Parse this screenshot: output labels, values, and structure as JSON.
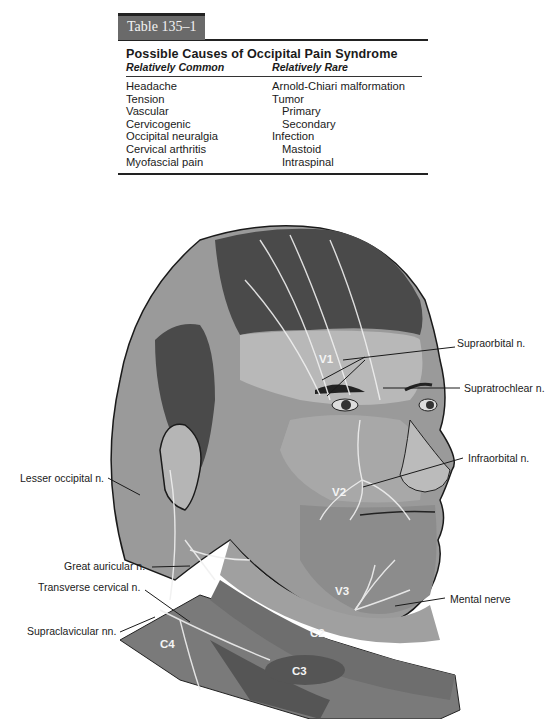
{
  "table": {
    "tag": "Table 135–1",
    "title": "Possible Causes of Occipital Pain Syndrome",
    "columns": [
      "Relatively Common",
      "Relatively Rare"
    ],
    "common": [
      "Headache",
      "Tension",
      "Vascular",
      "Cervicogenic",
      "Occipital neuralgia",
      "Cervical arthritis",
      "Myofascial pain"
    ],
    "rare": [
      {
        "text": "Arnold-Chiari malformation",
        "indent": false
      },
      {
        "text": "Tumor",
        "indent": false
      },
      {
        "text": "Primary",
        "indent": true
      },
      {
        "text": "Secondary",
        "indent": true
      },
      {
        "text": "Infection",
        "indent": false
      },
      {
        "text": "Mastoid",
        "indent": true
      },
      {
        "text": "Intraspinal",
        "indent": true
      }
    ]
  },
  "figure": {
    "nerve_labels": {
      "supraorbital": "Supraorbital n.",
      "supratrochlear": "Supratrochlear n.",
      "infraorbital": "Infraorbital n.",
      "lesser_occipital": "Lesser occipital n.",
      "great_auricular": "Great auricular n.",
      "transverse_cervical": "Transverse cervical n.",
      "supraclavicular": "Supraclavicular nn.",
      "mental": "Mental nerve"
    },
    "zones": {
      "v1": "V1",
      "v2": "V2",
      "v3": "V3",
      "c2": "C2",
      "c3": "C3",
      "c4": "C4"
    }
  }
}
